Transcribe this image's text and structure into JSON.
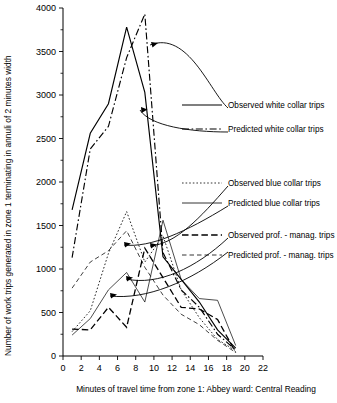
{
  "chart_data": {
    "type": "line",
    "title": "",
    "xlabel": "Minutes of travel time from zone 1: Abbey ward: Central Reading",
    "ylabel": "Number of work trips generated in zone 1 terminating in annuli of 2 minutes width",
    "xlim": [
      0,
      22
    ],
    "ylim": [
      0,
      4000
    ],
    "xticks": [
      0,
      2,
      4,
      6,
      8,
      10,
      12,
      14,
      16,
      18,
      20,
      22
    ],
    "xticklabels": [
      "0",
      "2",
      "4",
      "6",
      "8",
      "10",
      "12",
      "14",
      "16",
      "18",
      "20",
      "22"
    ],
    "yticks": [
      0,
      500,
      1000,
      1500,
      2000,
      2500,
      3000,
      3500,
      4000
    ],
    "yticklabels": [
      "0",
      "500",
      "1000",
      "1500",
      "2000",
      "2500",
      "3000",
      "3500",
      "4000"
    ],
    "y_minor_ticks": [
      250,
      750,
      1250,
      1750,
      2250,
      2750,
      3250,
      3750
    ],
    "grid": false,
    "legend_position": "right",
    "series": [
      {
        "name": "Observed white collar trips",
        "style": "solid",
        "width": 1.15,
        "color": "#000000",
        "x": [
          1,
          3,
          5,
          7,
          9,
          11,
          13,
          15,
          17,
          19
        ],
        "y": [
          1680,
          2560,
          2900,
          3780,
          3030,
          1140,
          880,
          620,
          300,
          90
        ]
      },
      {
        "name": "Predicted white collar trips",
        "style": "dashdot",
        "width": 1.15,
        "color": "#000000",
        "x": [
          1,
          3,
          5,
          7,
          9,
          11,
          13,
          15,
          17,
          19
        ],
        "y": [
          1130,
          2380,
          2640,
          3430,
          3930,
          1190,
          760,
          560,
          250,
          70
        ]
      },
      {
        "name": "Observed blue collar trips",
        "style": "dotted",
        "width": 0.85,
        "color": "#000000",
        "x": [
          1,
          3,
          5,
          7,
          9,
          11,
          13,
          15,
          17,
          19
        ],
        "y": [
          280,
          520,
          1180,
          1660,
          1080,
          1380,
          760,
          440,
          190,
          60
        ]
      },
      {
        "name": "Predicted blue collar trips",
        "style": "solid-thin",
        "width": 0.7,
        "color": "#000000",
        "x": [
          1,
          3,
          5,
          7,
          9,
          11,
          13,
          15,
          17,
          19
        ],
        "y": [
          240,
          430,
          760,
          960,
          620,
          1560,
          880,
          660,
          640,
          120
        ]
      },
      {
        "name": "Observed prof.-manag. trips",
        "style": "dashed-bold",
        "width": 1.3,
        "color": "#000000",
        "x": [
          1,
          3,
          5,
          7,
          9,
          11,
          13,
          15,
          17,
          19
        ],
        "y": [
          310,
          300,
          560,
          330,
          1240,
          900,
          560,
          540,
          420,
          40
        ]
      },
      {
        "name": "Predicted prof.-manag. trips",
        "style": "dashed-thin",
        "width": 0.75,
        "color": "#000000",
        "x": [
          1,
          3,
          5,
          7,
          9,
          11,
          13,
          15,
          17,
          19
        ],
        "y": [
          780,
          1080,
          1210,
          1440,
          1020,
          700,
          480,
          360,
          180,
          40
        ]
      }
    ]
  },
  "legend": {
    "items": [
      {
        "label": "Observed white collar trips",
        "style": "solid",
        "key": "obs-white"
      },
      {
        "label": "Predicted white collar trips",
        "style": "dashdot",
        "key": "pred-white"
      },
      {
        "label": "Observed blue collar trips",
        "style": "dotted",
        "key": "obs-blue"
      },
      {
        "label": "Predicted blue collar trips",
        "style": "solid-thin",
        "key": "pred-blue"
      },
      {
        "label": "Observed prof. - manag. trips",
        "style": "dashed-bold",
        "key": "obs-prof"
      },
      {
        "label": "Predicted prof. - manag. trips",
        "style": "dashed-thin",
        "key": "pred-prof"
      }
    ]
  },
  "axes": {
    "x_title": "Minutes of travel time from zone 1: Abbey ward: Central Reading",
    "y_title": "Number of work trips generated in zone 1 terminating in annuli of 2 minutes width",
    "x_labels": [
      "0",
      "2",
      "4",
      "6",
      "8",
      "10",
      "12",
      "14",
      "16",
      "18",
      "20",
      "22"
    ],
    "y_labels": [
      "0",
      "500",
      "1000",
      "1500",
      "2000",
      "2500",
      "3000",
      "3500",
      "4000"
    ]
  },
  "colors": {
    "ink": "#000000",
    "background": "#ffffff"
  }
}
